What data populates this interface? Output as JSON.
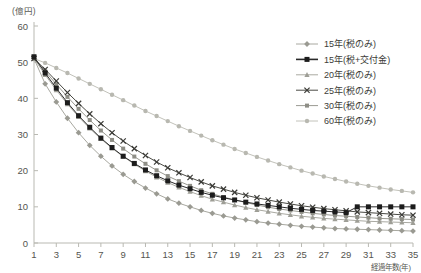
{
  "chart_data": {
    "type": "line",
    "title": "",
    "subtitle": "",
    "xlabel": "経過年数(年)",
    "ylabel": "",
    "yunit": "(億円)",
    "xlim": [
      1,
      35
    ],
    "ylim": [
      0,
      60
    ],
    "ytick_labels": [
      "0",
      "10",
      "20",
      "30",
      "40",
      "50",
      "60"
    ],
    "ytick_values": [
      0,
      10,
      20,
      30,
      40,
      50,
      60
    ],
    "xtick_labels": [
      "1",
      "3",
      "5",
      "7",
      "9",
      "11",
      "13",
      "15",
      "17",
      "19",
      "21",
      "23",
      "25",
      "27",
      "29",
      "31",
      "33",
      "35"
    ],
    "xtick_values": [
      1,
      3,
      5,
      7,
      9,
      11,
      13,
      15,
      17,
      19,
      21,
      23,
      25,
      27,
      29,
      31,
      33,
      35
    ],
    "x": [
      1,
      2,
      3,
      4,
      5,
      6,
      7,
      8,
      9,
      10,
      11,
      12,
      13,
      14,
      15,
      16,
      17,
      18,
      19,
      20,
      21,
      22,
      23,
      24,
      25,
      26,
      27,
      28,
      29,
      30,
      31,
      32,
      33,
      34,
      35
    ],
    "grid": false,
    "legend_position": "top-right",
    "series": [
      {
        "name": "15年(税のみ)",
        "marker": "diamond",
        "color": "#9a9a92",
        "line_color": "#a8a8a0",
        "values": [
          51.0,
          44.0,
          39.0,
          34.5,
          30.5,
          27.0,
          24.0,
          21.3,
          19.0,
          17.0,
          15.2,
          13.6,
          12.2,
          11.0,
          10.0,
          9.0,
          8.2,
          7.5,
          6.9,
          6.4,
          5.9,
          5.5,
          5.2,
          4.9,
          4.6,
          4.4,
          4.2,
          4.0,
          3.9,
          3.8,
          3.7,
          3.6,
          3.5,
          3.4,
          3.3
        ]
      },
      {
        "name": "15年(税+交付金)",
        "marker": "square-filled",
        "color": "#1c1c1c",
        "line_color": "#2a2a2a",
        "values": [
          51.5,
          47.0,
          42.8,
          38.8,
          35.2,
          32.0,
          29.0,
          26.4,
          24.0,
          22.0,
          20.2,
          18.6,
          17.2,
          16.0,
          15.0,
          14.0,
          13.2,
          12.5,
          11.9,
          11.3,
          10.8,
          10.4,
          10.0,
          9.6,
          9.3,
          9.0,
          8.8,
          8.6,
          8.4,
          10.0,
          10.0,
          10.0,
          10.0,
          10.0,
          10.0
        ]
      },
      {
        "name": "20年(税のみ)",
        "marker": "triangle",
        "color": "#9e9e96",
        "line_color": "#aaaaa2",
        "values": [
          51.0,
          46.5,
          42.3,
          38.4,
          34.9,
          31.7,
          28.8,
          26.2,
          23.9,
          21.8,
          19.9,
          18.2,
          16.7,
          15.4,
          14.2,
          13.1,
          12.1,
          11.3,
          10.5,
          9.8,
          9.2,
          8.7,
          8.2,
          7.8,
          7.4,
          7.1,
          6.8,
          6.6,
          6.4,
          6.2,
          6.0,
          5.9,
          5.8,
          5.7,
          5.6
        ]
      },
      {
        "name": "25年(税のみ)",
        "marker": "x",
        "color": "#3a3a36",
        "line_color": "#4a4a44",
        "values": [
          51.0,
          48.0,
          44.8,
          41.6,
          38.6,
          35.7,
          33.0,
          30.5,
          28.2,
          26.1,
          24.2,
          22.4,
          20.8,
          19.4,
          18.1,
          16.9,
          15.8,
          14.9,
          14.0,
          13.2,
          12.5,
          11.9,
          11.3,
          10.8,
          10.3,
          9.9,
          9.5,
          9.2,
          8.9,
          8.6,
          8.4,
          8.2,
          8.0,
          7.8,
          7.7
        ]
      },
      {
        "name": "30年(税のみ)",
        "marker": "square-small",
        "color": "#8e8e86",
        "line_color": "#9a9a92",
        "values": [
          51.0,
          47.5,
          43.9,
          40.4,
          37.1,
          34.0,
          31.1,
          28.5,
          26.1,
          23.9,
          21.9,
          20.1,
          18.5,
          17.1,
          15.8,
          14.6,
          13.6,
          12.7,
          11.9,
          11.2,
          10.5,
          9.9,
          9.4,
          9.0,
          8.6,
          8.2,
          7.9,
          7.6,
          7.4,
          7.2,
          7.0,
          6.8,
          6.7,
          6.6,
          6.5
        ]
      },
      {
        "name": "60年(税のみ)",
        "marker": "circle",
        "color": "#b8b8b0",
        "line_color": "#c2c2ba",
        "values": [
          51.0,
          49.8,
          48.4,
          47.0,
          45.5,
          44.0,
          42.5,
          41.0,
          39.5,
          38.0,
          36.5,
          35.1,
          33.7,
          32.3,
          31.0,
          29.7,
          28.4,
          27.2,
          26.0,
          24.9,
          23.8,
          22.8,
          21.8,
          20.9,
          20.0,
          19.2,
          18.4,
          17.7,
          17.0,
          16.4,
          15.8,
          15.3,
          14.8,
          14.4,
          14.0
        ]
      }
    ]
  }
}
